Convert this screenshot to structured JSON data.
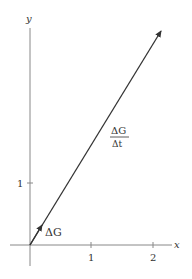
{
  "axes": {
    "x_label": "x",
    "y_label": "y",
    "x_ticks": [
      "1",
      "2"
    ],
    "y_ticks": [
      "1"
    ]
  },
  "vectors": {
    "small": {
      "label": "ΔG",
      "from": [
        0,
        0
      ],
      "to": [
        0.15,
        0.25
      ]
    },
    "large": {
      "label_num": "ΔG",
      "label_den": "Δt",
      "from": [
        0,
        0
      ],
      "to": [
        2.1,
        3.5
      ]
    }
  },
  "colors": {
    "axis": "#888888",
    "vector": "#333333",
    "text": "#333333"
  }
}
